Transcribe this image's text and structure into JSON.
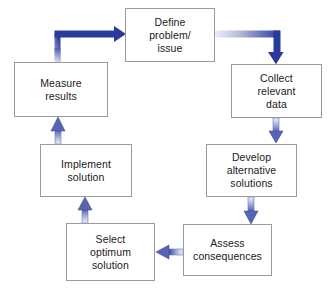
{
  "diagram": {
    "background_color": "#ffffff",
    "box_border_color": "#9a9a9a",
    "box_fill_color": "#ffffff",
    "arrow_color_dark": "#2a3a9c",
    "arrow_color_light": "#d8dced",
    "text_color": "#1a1a1a",
    "nodes": [
      {
        "id": "define-problem",
        "label": "Define\nproblem/\nissue",
        "line1": "Define",
        "line2": "problem/",
        "line3": "issue",
        "x": 125,
        "y": 8,
        "w": 90,
        "h": 54
      },
      {
        "id": "collect-data",
        "label": "Collect\nrelevant\ndata",
        "line1": "Collect",
        "line2": "relevant",
        "line3": "data",
        "x": 231,
        "y": 64,
        "w": 91,
        "h": 54
      },
      {
        "id": "develop-alternatives",
        "label": "Develop\nalternative\nsolutions",
        "line1": "Develop",
        "line2": "alternative",
        "line3": "solutions",
        "x": 206,
        "y": 144,
        "w": 91,
        "h": 53
      },
      {
        "id": "assess-consequences",
        "label": "Assess\nconsequences",
        "line1": "Assess",
        "line2": "consequences",
        "line3": "",
        "x": 183,
        "y": 224,
        "w": 89,
        "h": 52
      },
      {
        "id": "select-optimum",
        "label": "Select\noptimum\nsolution",
        "line1": "Select",
        "line2": "optimum",
        "line3": "solution",
        "x": 66,
        "y": 223,
        "w": 89,
        "h": 58
      },
      {
        "id": "implement-solution",
        "label": "Implement\nsolution",
        "line1": "Implement",
        "line2": "solution",
        "line3": "",
        "x": 40,
        "y": 144,
        "w": 92,
        "h": 53
      },
      {
        "id": "measure-results",
        "label": "Measure\nresults",
        "line1": "Measure",
        "line2": "results",
        "line3": "",
        "x": 14,
        "y": 62,
        "w": 94,
        "h": 55
      }
    ],
    "connections": [
      {
        "id": "measure-to-define",
        "from": "measure-results",
        "to": "define-problem",
        "style": "thick-elbow"
      },
      {
        "id": "define-to-collect",
        "from": "define-problem",
        "to": "collect-data",
        "style": "thick-elbow"
      },
      {
        "id": "collect-to-develop",
        "from": "collect-data",
        "to": "develop-alternatives",
        "style": "thin-down"
      },
      {
        "id": "develop-to-assess",
        "from": "develop-alternatives",
        "to": "assess-consequences",
        "style": "thin-down"
      },
      {
        "id": "assess-to-select",
        "from": "assess-consequences",
        "to": "select-optimum",
        "style": "thin-left"
      },
      {
        "id": "select-to-implement",
        "from": "select-optimum",
        "to": "implement-solution",
        "style": "thin-up"
      },
      {
        "id": "implement-to-measure",
        "from": "implement-solution",
        "to": "measure-results",
        "style": "thin-up"
      }
    ]
  }
}
